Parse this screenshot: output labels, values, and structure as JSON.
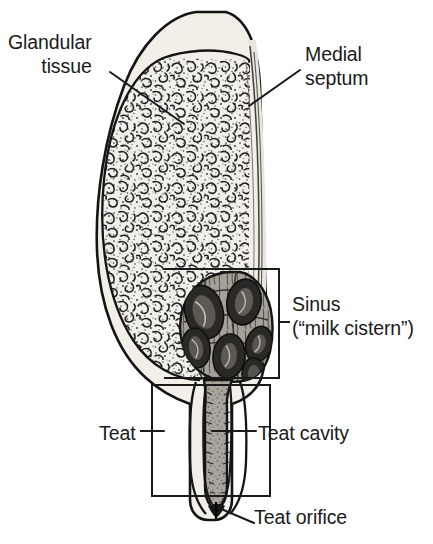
{
  "figure": {
    "background_color": "#ffffff",
    "ink_color": "#1a1a1a"
  },
  "labels": {
    "glandular": {
      "line1": "Glandular",
      "line2": "tissue"
    },
    "medial": {
      "line1": "Medial",
      "line2": "septum"
    },
    "sinus": {
      "line1": "Sinus",
      "line2": "(“milk cistern”)"
    },
    "teat": "Teat",
    "teat_cavity": "Teat cavity",
    "teat_orifice": "Teat orifice"
  },
  "structures": {
    "skin": {
      "name": "outer skin layer",
      "fill": "#efece6",
      "stroke": "#141414"
    },
    "glandular_tissue": {
      "name": "glandular tissue parenchyma",
      "fill": "#f0eee9",
      "stipple": "#2a2a2a"
    },
    "medial_septum": {
      "name": "medial septum",
      "fill": "#e8e5de",
      "stroke": "#3a3a3a"
    },
    "sinus": {
      "name": "gland sinus / milk cistern",
      "fill": "#9e9a93",
      "stroke": "#141414",
      "lobule_count": 6,
      "lobule_fill": "#2b2926"
    },
    "teat_cavity": {
      "name": "teat cavity",
      "fill": "#a8a49c",
      "wall": "#171717"
    },
    "teat_orifice": {
      "name": "teat orifice",
      "fill": "#1a1a1a"
    }
  },
  "annotations": {
    "sinus_bracket": {
      "name": "sinus-bracket",
      "shape": "open-rectangle-left"
    },
    "teat_bracket": {
      "name": "teat-bracket",
      "shape": "rectangle"
    },
    "leader_lines": [
      "glandular",
      "medial-septum",
      "teat",
      "teat-cavity",
      "teat-orifice"
    ]
  }
}
